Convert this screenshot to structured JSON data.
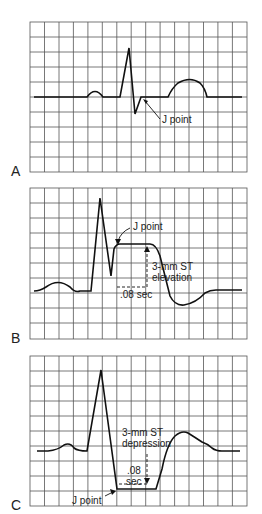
{
  "figure": {
    "grid": {
      "cols": 15,
      "rows": 10,
      "line_color": "#333333",
      "trace_color": "#111111"
    },
    "panels": [
      {
        "letter": "A",
        "labels": {
          "j_point": "J point"
        }
      },
      {
        "letter": "B",
        "labels": {
          "j_point": "J point",
          "st_line1": "3-mm ST",
          "st_line2": "elevation",
          "interval": ".08 sec"
        }
      },
      {
        "letter": "C",
        "labels": {
          "j_point": "J point",
          "st_line1": "3-mm ST",
          "st_line2": "depression",
          "interval_line1": ".08",
          "interval_line2": "sec"
        }
      }
    ]
  }
}
